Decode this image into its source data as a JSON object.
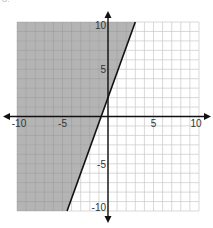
{
  "problem_label": "8.",
  "chart_data": {
    "type": "line",
    "title": "",
    "xlabel": "",
    "ylabel": "",
    "xlim": [
      -10,
      10
    ],
    "ylim": [
      -10,
      10
    ],
    "grid": true,
    "grid_step": 1,
    "x_tick_labels": [
      "-10",
      "-5",
      "5",
      "10"
    ],
    "x_ticks": [
      -10,
      -5,
      5,
      10
    ],
    "y_tick_labels": [
      "10",
      "5",
      "-5",
      "-10"
    ],
    "y_ticks": [
      10,
      5,
      -5,
      -10
    ],
    "series": [
      {
        "name": "boundary line",
        "style": "solid",
        "equation": "y = (8/3)x + 2",
        "slope": 2.667,
        "y_intercept": 2,
        "points": [
          [
            -4.5,
            -10
          ],
          [
            0,
            2
          ],
          [
            3,
            10
          ]
        ]
      }
    ],
    "shaded_region": {
      "side": "left/above the line",
      "inequality": "y >= (8/3)x + 2",
      "color": "#b4b4b4"
    },
    "colors": {
      "shade": "#b4b4b4",
      "grid": "#c8c8c8",
      "grid_on_shade": "#9a9a9a",
      "axis": "#111111",
      "line": "#111111"
    }
  }
}
